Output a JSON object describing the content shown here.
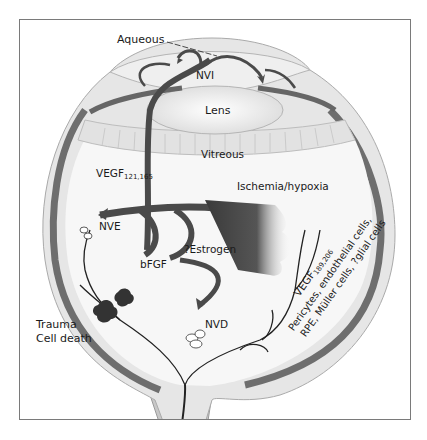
{
  "figure": {
    "labels": {
      "aqueous": "Aqueous",
      "nvi": "NVI",
      "lens": "Lens",
      "vitreous": "Vitreous",
      "vegf_main": "VEGF",
      "vegf_main_sub": "121,165",
      "nve": "NVE",
      "ischemia": "Ischemia/hypoxia",
      "estrogen": "?Estrogen",
      "bfgf": "bFGF",
      "nvd": "NVD",
      "trauma": "Trauma",
      "cell_death": "Cell death",
      "vegf_retina": "VEGF",
      "vegf_retina_sub": "189,206",
      "pericytes": "Pericytes, endothelial cells,",
      "rpe": "RPE, Müller cells, ?glial cells"
    },
    "colors": {
      "frame": "#7a7a7a",
      "sclera": "#e6e6e6",
      "choroid": "#6e6e6e",
      "arrow": "#4a4a4a",
      "vessel": "#222222",
      "background": "#ffffff"
    }
  }
}
